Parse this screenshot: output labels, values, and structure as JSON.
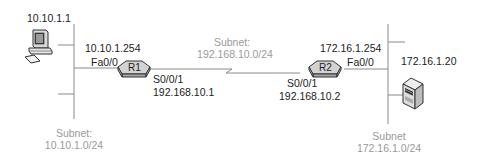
{
  "diagram": {
    "colors": {
      "line": "#8a8a8a",
      "text": "#222222",
      "subnet_text": "#9a9a9a"
    },
    "nodes": {
      "pc": {
        "ip": "10.10.1.1",
        "icon": "desktop-pc-icon"
      },
      "r1": {
        "name": "R1",
        "icon": "router-icon",
        "fa_label": "Fa0/0",
        "fa_ip": "10.10.1.254",
        "serial_label": "S0/0/1",
        "serial_ip": "192.168.10.1"
      },
      "r2": {
        "name": "R2",
        "icon": "router-icon",
        "fa_label": "Fa0/0",
        "fa_ip": "172.16.1.254",
        "serial_label": "S0/0/1",
        "serial_ip": "192.168.10.2"
      },
      "server": {
        "ip": "172.16.1.20",
        "icon": "server-icon"
      }
    },
    "subnets": {
      "left": {
        "title": "Subnet:",
        "network": "10.10.1.0/24"
      },
      "middle": {
        "title": "Subnet:",
        "network": "192.168.10.0/24"
      },
      "right": {
        "title": "Subnet",
        "network": "172.16.1.0/24"
      }
    }
  }
}
